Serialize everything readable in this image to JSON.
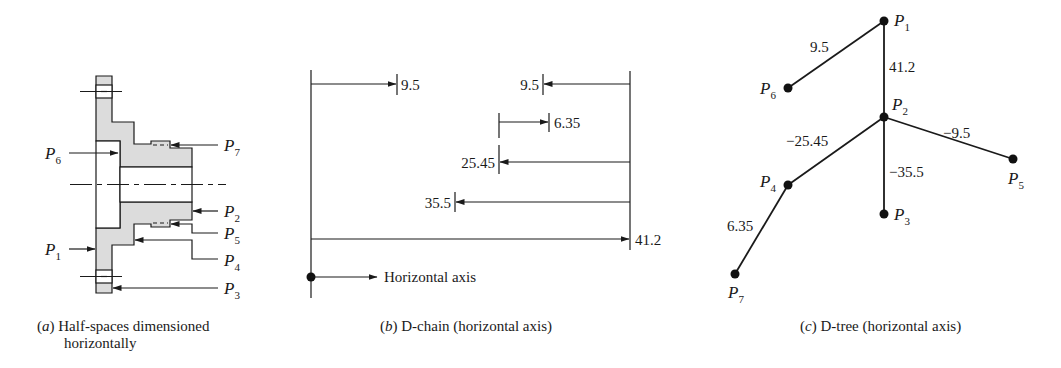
{
  "panels": {
    "a": {
      "caption_tag": "a",
      "caption_line1": "Half-spaces dimensioned",
      "caption_line2": "horizontally",
      "labels": {
        "P1": {
          "base": "P",
          "sub": "1"
        },
        "P2": {
          "base": "P",
          "sub": "2"
        },
        "P3": {
          "base": "P",
          "sub": "3"
        },
        "P4": {
          "base": "P",
          "sub": "4"
        },
        "P5": {
          "base": "P",
          "sub": "5"
        },
        "P6": {
          "base": "P",
          "sub": "6"
        },
        "P7": {
          "base": "P",
          "sub": "7"
        }
      },
      "fill_color": "#dcdcdc"
    },
    "b": {
      "caption_tag": "b",
      "caption_text": "D-chain (horizontal axis)",
      "dimensions": [
        {
          "id": "d1",
          "value": "9.5",
          "direction": "right",
          "from": "left-datum"
        },
        {
          "id": "d2",
          "value": "9.5",
          "direction": "left",
          "from": "right-datum"
        },
        {
          "id": "d3",
          "value": "6.35",
          "direction": "right",
          "from": "25.45-datum"
        },
        {
          "id": "d4",
          "value": "25.45",
          "direction": "left",
          "from": "right-datum"
        },
        {
          "id": "d5",
          "value": "35.5",
          "direction": "left",
          "from": "right-datum"
        },
        {
          "id": "d6",
          "value": "41.2",
          "direction": "right",
          "from": "left-datum"
        }
      ],
      "axis_label": "Horizontal axis"
    },
    "c": {
      "caption_tag": "c",
      "caption_text": "D-tree (horizontal axis)",
      "nodes": [
        {
          "id": "P1",
          "base": "P",
          "sub": "1"
        },
        {
          "id": "P2",
          "base": "P",
          "sub": "2"
        },
        {
          "id": "P3",
          "base": "P",
          "sub": "3"
        },
        {
          "id": "P4",
          "base": "P",
          "sub": "4"
        },
        {
          "id": "P5",
          "base": "P",
          "sub": "5"
        },
        {
          "id": "P6",
          "base": "P",
          "sub": "6"
        },
        {
          "id": "P7",
          "base": "P",
          "sub": "7"
        }
      ],
      "edges": [
        {
          "from": "P1",
          "to": "P6",
          "value": "9.5"
        },
        {
          "from": "P1",
          "to": "P2",
          "value": "41.2"
        },
        {
          "from": "P2",
          "to": "P4",
          "value": "−25.45"
        },
        {
          "from": "P2",
          "to": "P5",
          "value": "−9.5"
        },
        {
          "from": "P2",
          "to": "P3",
          "value": "−35.5"
        },
        {
          "from": "P4",
          "to": "P7",
          "value": "6.35"
        }
      ]
    }
  }
}
